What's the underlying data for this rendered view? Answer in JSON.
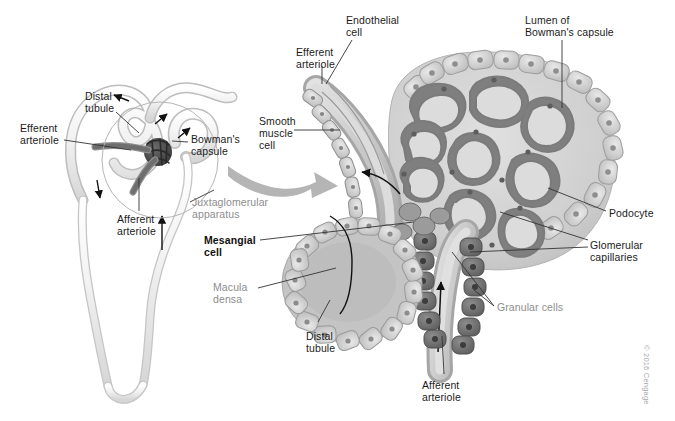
{
  "figure": {
    "copyright": "© 2016 Cengage",
    "palette": {
      "background": "#ffffff",
      "label_text": "#1b1b1b",
      "label_gray": "#8d8d8d",
      "leader_line": "#333333",
      "tubule_fill": "#ececec",
      "tubule_edge": "#b9b9b9",
      "capsule_fill": "#d3d3d3",
      "capillary_wall": "#8a8a8a",
      "capillary_lumen": "#d8d8d8",
      "granular_cell": "#6f6f6f",
      "epithelial_cell": "#c9c9c9",
      "arteriole_fill": "#c2c2c2",
      "glomerulus_tuft": "#4a4a4a",
      "transition_arrow": "#b0b0b0"
    }
  },
  "left_panel": {
    "name": "nephron-overview",
    "labels": [
      {
        "id": "distal-tubule",
        "text": "Distal\ntubule",
        "style": "plain",
        "x": 85,
        "y": 90,
        "align": "left"
      },
      {
        "id": "efferent-arteriole",
        "text": "Efferent\narteriole",
        "style": "plain",
        "x": 20,
        "y": 122,
        "align": "left"
      },
      {
        "id": "bowmans-capsule",
        "text": "Bowman's\ncapsule",
        "style": "plain",
        "x": 191,
        "y": 133,
        "align": "left"
      },
      {
        "id": "juxtaglomerular-apparatus",
        "text": "Juxtaglomerular\napparatus",
        "style": "gray",
        "x": 192,
        "y": 196,
        "align": "left"
      },
      {
        "id": "afferent-arteriole",
        "text": "Afferent\narteriole",
        "style": "plain",
        "x": 117,
        "y": 213,
        "align": "left"
      }
    ]
  },
  "right_panel": {
    "name": "glomerulus-detail",
    "labels": [
      {
        "id": "endothelial-cell",
        "text": "Endothelial\ncell",
        "style": "plain",
        "x": 346,
        "y": 14,
        "align": "left"
      },
      {
        "id": "lumen-of-bowmans-capsule",
        "text": "Lumen of\nBowman's capsule",
        "style": "plain",
        "x": 525,
        "y": 14,
        "align": "left"
      },
      {
        "id": "efferent-arteriole-detail",
        "text": "Efferent\narteriole",
        "style": "plain",
        "x": 296,
        "y": 46,
        "align": "left"
      },
      {
        "id": "smooth-muscle-cell",
        "text": "Smooth\nmuscle\ncell",
        "style": "plain",
        "x": 259,
        "y": 115,
        "align": "left"
      },
      {
        "id": "podocyte",
        "text": "Podocyte",
        "style": "plain",
        "x": 609,
        "y": 207,
        "align": "left"
      },
      {
        "id": "mesangial-cell",
        "text": "Mesangial\ncell",
        "style": "bold",
        "x": 204,
        "y": 234,
        "align": "left"
      },
      {
        "id": "glomerular-capillaries",
        "text": "Glomerular\ncapillaries",
        "style": "plain",
        "x": 590,
        "y": 239,
        "align": "left"
      },
      {
        "id": "macula-densa",
        "text": "Macula\ndensa",
        "style": "gray",
        "x": 213,
        "y": 281,
        "align": "left"
      },
      {
        "id": "granular-cells",
        "text": "Granular cells",
        "style": "gray",
        "x": 497,
        "y": 301,
        "align": "left"
      },
      {
        "id": "distal-tubule-detail",
        "text": "Distal\ntubule",
        "style": "plain",
        "x": 306,
        "y": 330,
        "align": "left"
      },
      {
        "id": "afferent-arteriole-detail",
        "text": "Afferent\narteriole",
        "style": "plain",
        "x": 422,
        "y": 379,
        "align": "left"
      }
    ]
  }
}
